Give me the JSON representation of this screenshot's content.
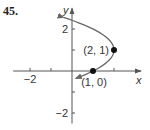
{
  "problem_number": "45.",
  "chart_data": {
    "type": "line",
    "title": "",
    "xlabel": "x",
    "ylabel": "y",
    "xlim": [
      -2.8,
      3.0
    ],
    "ylim": [
      -2.5,
      2.8
    ],
    "x_ticks": [
      -2,
      -1,
      1,
      2
    ],
    "x_tick_labels": [
      {
        "value": -2,
        "label": "−2"
      }
    ],
    "y_ticks": [
      -2,
      -1,
      1,
      2
    ],
    "y_tick_labels": [
      {
        "value": 2,
        "label": "2"
      },
      {
        "value": -2,
        "label": "−2"
      }
    ],
    "curve": {
      "equation": "x = 2 - (y - 1)^2",
      "y_range": [
        -0.35,
        2.55
      ],
      "arrows": "both ends",
      "color": "#666666"
    },
    "points": [
      {
        "x": 2,
        "y": 1,
        "label": "(2, 1)"
      },
      {
        "x": 1,
        "y": 0,
        "label": "(1, 0)"
      }
    ],
    "grid": false
  }
}
